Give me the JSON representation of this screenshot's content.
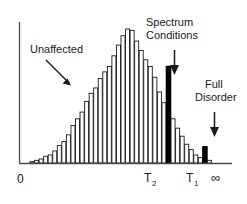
{
  "chart_data": {
    "type": "bar",
    "title": "",
    "subtitle": "",
    "xlabel": "",
    "ylabel": "",
    "grid": false,
    "legend_position": "none",
    "xlim": [
      0,
      46
    ],
    "ylim": [
      0,
      100
    ],
    "bar_count": 40,
    "categories": [
      "1",
      "2",
      "3",
      "4",
      "5",
      "6",
      "7",
      "8",
      "9",
      "10",
      "11",
      "12",
      "13",
      "14",
      "15",
      "16",
      "17",
      "18",
      "19",
      "20",
      "21",
      "22",
      "23",
      "24",
      "25",
      "26",
      "27",
      "28",
      "29",
      "30",
      "31",
      "32",
      "33",
      "34",
      "35",
      "36",
      "37",
      "38",
      "39",
      "40"
    ],
    "values": [
      1,
      2,
      3,
      5,
      6,
      9,
      13,
      16,
      21,
      28,
      33,
      38,
      46,
      52,
      56,
      63,
      68,
      72,
      80,
      88,
      95,
      100,
      99,
      91,
      84,
      77,
      72,
      64,
      53,
      45,
      72,
      33,
      26,
      20,
      14,
      10,
      6,
      4,
      12,
      2
    ],
    "highlight_indices": [
      30,
      38
    ],
    "highlight_color": "#000000",
    "bar_fill_color": "#ffffff",
    "bar_edge_color": "#1a1a1a",
    "axis_color": "#4a4a4a",
    "axis_ticks": [
      {
        "name": "origin",
        "label": "0",
        "sub": "",
        "x": 0
      },
      {
        "name": "t2",
        "label": "T",
        "sub": "2",
        "x": 30
      },
      {
        "name": "t1",
        "label": "T",
        "sub": "1",
        "x": 38
      },
      {
        "name": "infinity",
        "label": "∞",
        "sub": "",
        "x": 44
      }
    ],
    "annotations": [
      {
        "name": "unaffected",
        "lines": [
          "Unaffected"
        ],
        "arrow": "diagonal-down-right"
      },
      {
        "name": "spectrum-conditions",
        "lines": [
          "Spectrum",
          "Conditions"
        ],
        "arrow": "down"
      },
      {
        "name": "full-disorder",
        "lines": [
          "Full",
          "Disorder"
        ],
        "arrow": "down"
      }
    ]
  },
  "annotations": {
    "unaffected": {
      "line1": "Unaffected"
    },
    "spectrum_conditions": {
      "line1": "Spectrum",
      "line2": "Conditions"
    },
    "full_disorder": {
      "line1": "Full",
      "line2": "Disorder"
    }
  },
  "axis": {
    "origin_label": "0",
    "t2_label": "T",
    "t2_sub": "2",
    "t1_label": "T",
    "t1_sub": "1",
    "infinity_label": "∞"
  }
}
